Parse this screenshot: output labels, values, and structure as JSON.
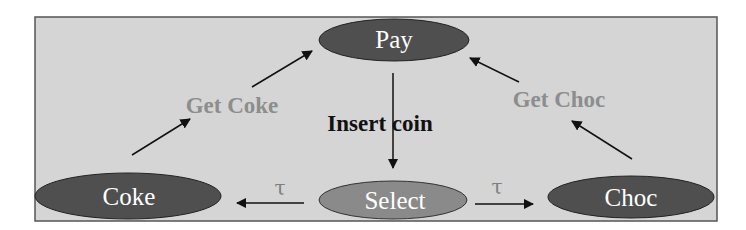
{
  "diagram": {
    "type": "state-transition",
    "colors": {
      "background": "#d5d5d5",
      "border": "#555555",
      "node_dark": "#4f4f4f",
      "node_light": "#8a8a8a",
      "node_text": "#ffffff",
      "edge": "#111111",
      "gray_label": "#8d8d8d",
      "tau_label": "#7e7e7e"
    },
    "nodes": {
      "pay": {
        "label": "Pay"
      },
      "select": {
        "label": "Select"
      },
      "coke": {
        "label": "Coke"
      },
      "choc": {
        "label": "Choc"
      }
    },
    "edges": {
      "insert_coin": {
        "from": "Pay",
        "to": "Select",
        "label": "Insert coin"
      },
      "tau_coke": {
        "from": "Select",
        "to": "Coke",
        "label": "τ"
      },
      "tau_choc": {
        "from": "Select",
        "to": "Choc",
        "label": "τ"
      },
      "get_coke": {
        "from": "Coke",
        "to": "Pay",
        "label": "Get Coke"
      },
      "get_choc": {
        "from": "Choc",
        "to": "Pay",
        "label": "Get Choc"
      }
    }
  }
}
